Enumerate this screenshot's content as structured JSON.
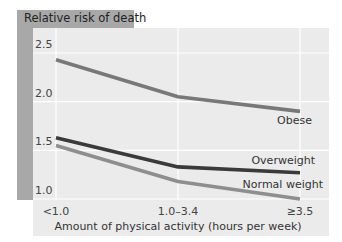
{
  "chart_data": {
    "type": "line",
    "title": "Relative risk of death",
    "xlabel": "Amount of physical activity (hours per week)",
    "ylabel": "Relative risk of death",
    "categories": [
      "<1.0",
      "1.0–3.4",
      "≥3.5"
    ],
    "yticks": [
      "2.5",
      "2.0",
      "1.5",
      "1.0"
    ],
    "ylim": [
      1.0,
      2.5
    ],
    "grid": true,
    "legend_position": "inline labels at line ends",
    "series": [
      {
        "name": "Obese",
        "values": [
          2.43,
          2.05,
          1.9
        ],
        "color": "#787878"
      },
      {
        "name": "Overweight",
        "values": [
          1.63,
          1.33,
          1.27
        ],
        "color": "#3a3a3a"
      },
      {
        "name": "Normal weight",
        "values": [
          1.55,
          1.18,
          1.0
        ],
        "color": "#8e8e8e"
      }
    ]
  },
  "colors": {
    "plot_background": "#ebebeb",
    "frame": "#a8a8a8",
    "gridline": "#ffffff"
  }
}
